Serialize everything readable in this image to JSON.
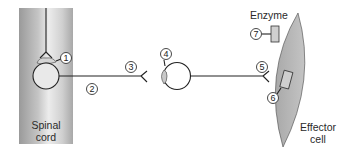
{
  "diagram": {
    "labels": {
      "spinal_cord_line1": "Spinal",
      "spinal_cord_line2": "cord",
      "enzyme": "Enzyme",
      "effector_line1": "Effector",
      "effector_line2": "cell"
    },
    "numbered_callouts": [
      {
        "id": "1",
        "target": "preganglionic-neuron-synapse"
      },
      {
        "id": "2",
        "target": "preganglionic-axon"
      },
      {
        "id": "3",
        "target": "preganglionic-nerve-terminal"
      },
      {
        "id": "4",
        "target": "ganglionic-receptor"
      },
      {
        "id": "5",
        "target": "postganglionic-nerve-terminal"
      },
      {
        "id": "6",
        "target": "effector-receptor"
      },
      {
        "id": "7",
        "target": "enzyme"
      }
    ],
    "colors": {
      "spinal_cord_fill_dark": "#8f8f8f",
      "spinal_cord_fill_light": "#e6e6e6",
      "effector_fill": "#b9b9b9",
      "receptor_fill": "#c8c8c8",
      "line": "#222222"
    }
  }
}
